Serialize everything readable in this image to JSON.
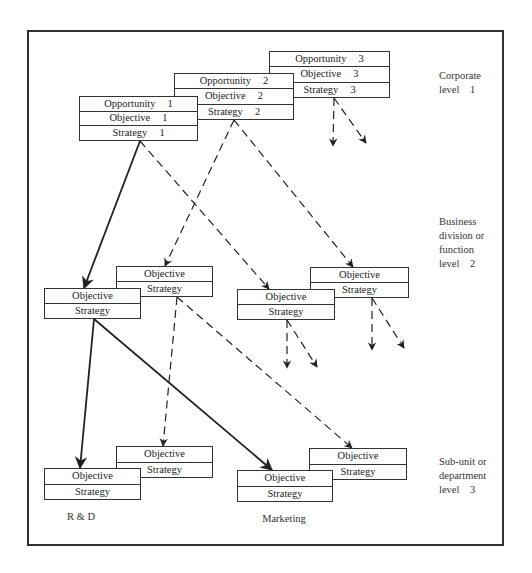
{
  "frame": {
    "x": 27,
    "y": 30,
    "w": 477,
    "h": 516
  },
  "levels": [
    {
      "text": "Corporate\nlevel    1",
      "x": 439,
      "y": 69
    },
    {
      "text": "Business\ndivision or\nfunction\nlevel    2",
      "x": 439,
      "y": 215
    },
    {
      "text": "Sub-unit or\ndepartment\nlevel    3",
      "x": 439,
      "y": 455
    }
  ],
  "corporate_boxes": [
    {
      "id": "corporate-3",
      "x": 269,
      "y": 51,
      "w": 121,
      "h": 47,
      "rows": [
        {
          "label": "Opportunity",
          "num": "3"
        },
        {
          "label": "Objective",
          "num": "3"
        },
        {
          "label": "Strategy",
          "num": "3"
        }
      ]
    },
    {
      "id": "corporate-2",
      "x": 174,
      "y": 73,
      "w": 120,
      "h": 47,
      "rows": [
        {
          "label": "Opportunity",
          "num": "2"
        },
        {
          "label": "Objective",
          "num": "2"
        },
        {
          "label": "Strategy",
          "num": "2"
        }
      ]
    },
    {
      "id": "corporate-1",
      "x": 79,
      "y": 96,
      "w": 119,
      "h": 45,
      "rows": [
        {
          "label": "Opportunity",
          "num": "1"
        },
        {
          "label": "Objective",
          "num": "1"
        },
        {
          "label": "Strategy",
          "num": "1"
        }
      ]
    }
  ],
  "division_boxes": [
    {
      "id": "division-a-back",
      "x": 116,
      "y": 266,
      "w": 97,
      "h": 31,
      "rows": [
        {
          "label": "Objective"
        },
        {
          "label": "Strategy"
        }
      ]
    },
    {
      "id": "division-a-front",
      "x": 44,
      "y": 288,
      "w": 97,
      "h": 31,
      "rows": [
        {
          "label": "Objective"
        },
        {
          "label": "Strategy"
        }
      ]
    },
    {
      "id": "division-b-back",
      "x": 310,
      "y": 267,
      "w": 99,
      "h": 31,
      "rows": [
        {
          "label": "Objective"
        },
        {
          "label": "Strategy"
        }
      ]
    },
    {
      "id": "division-b-front",
      "x": 237,
      "y": 289,
      "w": 98,
      "h": 31,
      "rows": [
        {
          "label": "Objective"
        },
        {
          "label": "Strategy"
        }
      ]
    }
  ],
  "department_boxes": [
    {
      "id": "rnd-back",
      "x": 116,
      "y": 446,
      "w": 97,
      "h": 32,
      "rows": [
        {
          "label": "Objective"
        },
        {
          "label": "Strategy"
        }
      ]
    },
    {
      "id": "rnd-front",
      "x": 44,
      "y": 468,
      "w": 97,
      "h": 32,
      "rows": [
        {
          "label": "Objective"
        },
        {
          "label": "Strategy"
        }
      ]
    },
    {
      "id": "marketing-back",
      "x": 309,
      "y": 448,
      "w": 98,
      "h": 32,
      "rows": [
        {
          "label": "Objective"
        },
        {
          "label": "Strategy"
        }
      ]
    },
    {
      "id": "marketing-front",
      "x": 237,
      "y": 470,
      "w": 96,
      "h": 32,
      "rows": [
        {
          "label": "Objective"
        },
        {
          "label": "Strategy"
        }
      ]
    }
  ],
  "units": [
    {
      "text": "R & D",
      "x": 81,
      "y": 511
    },
    {
      "text": "Marketing",
      "x": 284,
      "y": 513
    }
  ],
  "connections": [
    {
      "from": "Strategy 1",
      "to": "division-a-front",
      "style": "solid",
      "x1": 140,
      "y1": 141,
      "x2": 84,
      "y2": 288
    },
    {
      "from": "Strategy 1",
      "to": "division-b-front",
      "style": "dashed",
      "x1": 140,
      "y1": 141,
      "x2": 269,
      "y2": 289
    },
    {
      "from": "Strategy 2",
      "to": "division-a-back",
      "style": "dashed",
      "x1": 234,
      "y1": 120,
      "x2": 165,
      "y2": 266
    },
    {
      "from": "Strategy 2",
      "to": "division-b-back",
      "style": "dashed",
      "x1": 234,
      "y1": 120,
      "x2": 353,
      "y2": 267
    },
    {
      "from": "Strategy 3",
      "to": "offpage",
      "style": "dashed",
      "x1": 334,
      "y1": 98,
      "x2": 333,
      "y2": 146
    },
    {
      "from": "Strategy 3",
      "to": "offpage",
      "style": "dashed",
      "x1": 334,
      "y1": 98,
      "x2": 366,
      "y2": 143
    },
    {
      "from": "division-a-front",
      "to": "rnd-front",
      "style": "solid",
      "x1": 94,
      "y1": 319,
      "x2": 80,
      "y2": 468
    },
    {
      "from": "division-a-front",
      "to": "marketing-front",
      "style": "solid",
      "x1": 94,
      "y1": 319,
      "x2": 272,
      "y2": 470
    },
    {
      "from": "division-a-back",
      "to": "rnd-back",
      "style": "dashed",
      "x1": 177,
      "y1": 297,
      "x2": 163,
      "y2": 446
    },
    {
      "from": "division-a-back",
      "to": "marketing-back",
      "style": "dashed",
      "x1": 177,
      "y1": 297,
      "x2": 352,
      "y2": 448
    },
    {
      "from": "division-b-front",
      "to": "offpage",
      "style": "dashed",
      "x1": 287,
      "y1": 320,
      "x2": 287,
      "y2": 368
    },
    {
      "from": "division-b-front",
      "to": "offpage",
      "style": "dashed",
      "x1": 287,
      "y1": 320,
      "x2": 317,
      "y2": 367
    },
    {
      "from": "division-b-back",
      "to": "offpage",
      "style": "dashed",
      "x1": 372,
      "y1": 298,
      "x2": 372,
      "y2": 350
    },
    {
      "from": "division-b-back",
      "to": "offpage",
      "style": "dashed",
      "x1": 372,
      "y1": 298,
      "x2": 404,
      "y2": 348
    }
  ]
}
